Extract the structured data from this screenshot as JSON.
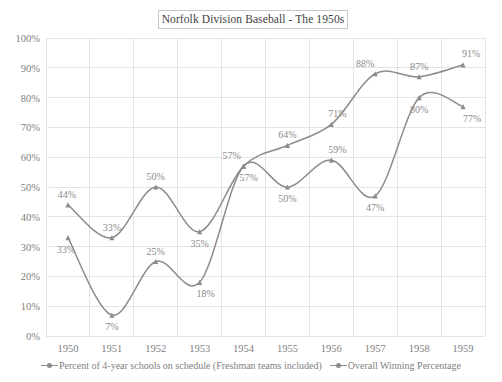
{
  "chart_data": {
    "type": "line",
    "title": "Norfolk Division Baseball - The 1950s",
    "xlabel": "",
    "ylabel": "",
    "categories": [
      "1950",
      "1951",
      "1952",
      "1953",
      "1954",
      "1955",
      "1956",
      "1957",
      "1958",
      "1959"
    ],
    "ylim": [
      0,
      100
    ],
    "ytick_labels": [
      "0%",
      "10%",
      "20%",
      "30%",
      "40%",
      "50%",
      "60%",
      "70%",
      "80%",
      "90%",
      "100%"
    ],
    "ytick_values": [
      0,
      10,
      20,
      30,
      40,
      50,
      60,
      70,
      80,
      90,
      100
    ],
    "grid": true,
    "legend_position": "bottom",
    "smoothing": "spline",
    "series": [
      {
        "name": "Percent of 4-year schools on schedule (Freshman teams included)",
        "color": "#8c8c8c",
        "values": [
          44,
          33,
          50,
          35,
          57,
          64,
          71,
          88,
          87,
          91
        ],
        "labels": [
          "44%",
          "33%",
          "50%",
          "35%",
          "57%",
          "64%",
          "71%",
          "88%",
          "87%",
          "91%"
        ]
      },
      {
        "name": "Overall Winning Percentage",
        "color": "#8c8c8c",
        "values": [
          33,
          7,
          25,
          18,
          57,
          50,
          59,
          47,
          80,
          77
        ],
        "labels": [
          "33%",
          "7%",
          "25%",
          "18%",
          "57%",
          "50%",
          "59%",
          "47%",
          "80%",
          "77%"
        ]
      }
    ]
  }
}
